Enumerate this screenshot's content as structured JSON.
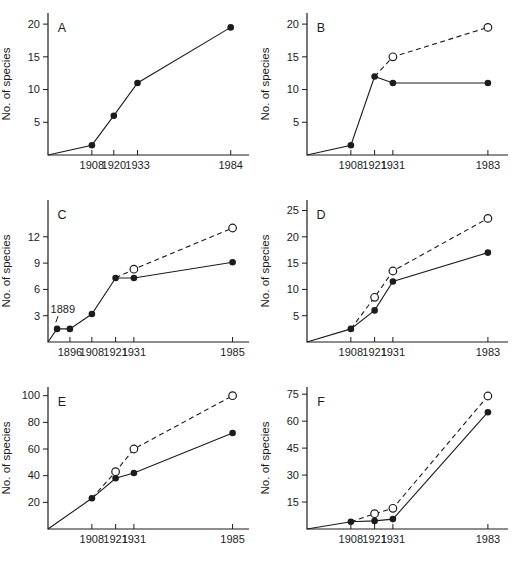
{
  "figure": {
    "background": "#ffffff",
    "ink": "#1c1c1c",
    "open_marker_fill": "#ffffff"
  },
  "chart_data": [
    {
      "type": "line",
      "panel": "A",
      "ylabel": "No. of species",
      "yticks": [
        5,
        10,
        15,
        20
      ],
      "ymax": 21.7,
      "x_domain": [
        1884,
        1994
      ],
      "xticks": [
        1908,
        1920,
        1933,
        1984
      ],
      "series": [
        {
          "name": "species recorded",
          "style": "solid",
          "marker": "filled",
          "marker_skip_first": true,
          "points": [
            [
              1884,
              0
            ],
            [
              1908,
              1.5
            ],
            [
              1920,
              6
            ],
            [
              1933,
              11
            ],
            [
              1984,
              19.5
            ]
          ]
        }
      ]
    },
    {
      "type": "line",
      "panel": "B",
      "ylabel": "No. of species",
      "yticks": [
        5,
        10,
        15,
        20
      ],
      "ymax": 21.7,
      "x_domain": [
        1884,
        1994
      ],
      "xticks": [
        1908,
        1921,
        1931,
        1983
      ],
      "series": [
        {
          "name": "species recorded",
          "style": "solid",
          "marker": "filled",
          "marker_skip_first": true,
          "points": [
            [
              1884,
              0
            ],
            [
              1908,
              1.5
            ],
            [
              1921,
              12
            ],
            [
              1931,
              11
            ],
            [
              1983,
              11
            ]
          ]
        },
        {
          "name": "cumulative species",
          "style": "dashed",
          "marker": "open",
          "marker_skip_first": true,
          "points": [
            [
              1921,
              12
            ],
            [
              1931,
              15
            ],
            [
              1983,
              19.5
            ]
          ]
        }
      ]
    },
    {
      "type": "line",
      "panel": "C",
      "ylabel": "No. of species",
      "yticks": [
        3,
        6,
        9,
        12
      ],
      "ymax": 16.2,
      "x_domain": [
        1884,
        1994
      ],
      "xticks": [
        1896,
        1908,
        1921,
        1931,
        1985
      ],
      "annotation": {
        "text": "1889",
        "label_year": 1885.4,
        "label_value": 3.3,
        "leader": [
          [
            1889.5,
            2.95
          ],
          [
            1888.3,
            2.25
          ]
        ]
      },
      "series": [
        {
          "name": "species recorded",
          "style": "solid",
          "marker": "filled",
          "marker_skip_first": true,
          "points": [
            [
              1884,
              0
            ],
            [
              1889,
              1.5
            ],
            [
              1896,
              1.5
            ],
            [
              1908,
              3.2
            ],
            [
              1921,
              7.3
            ],
            [
              1931,
              7.3
            ],
            [
              1985,
              9.1
            ]
          ]
        },
        {
          "name": "cumulative species",
          "style": "dashed",
          "marker": "open",
          "marker_skip_first": true,
          "points": [
            [
              1921,
              7.3
            ],
            [
              1931,
              8.3
            ],
            [
              1985,
              13
            ]
          ]
        }
      ]
    },
    {
      "type": "line",
      "panel": "D",
      "ylabel": "No. of species",
      "yticks": [
        5,
        10,
        15,
        20,
        25
      ],
      "ymax": 27,
      "x_domain": [
        1884,
        1994
      ],
      "xticks": [
        1908,
        1921,
        1931,
        1983
      ],
      "series": [
        {
          "name": "species recorded",
          "style": "solid",
          "marker": "filled",
          "marker_skip_first": true,
          "points": [
            [
              1884,
              0
            ],
            [
              1908,
              2.5
            ],
            [
              1921,
              6
            ],
            [
              1931,
              11.5
            ],
            [
              1983,
              17
            ]
          ]
        },
        {
          "name": "cumulative species",
          "style": "dashed",
          "marker": "open",
          "marker_skip_first": true,
          "points": [
            [
              1908,
              2.5
            ],
            [
              1921,
              8.5
            ],
            [
              1931,
              13.5
            ],
            [
              1983,
              23.5
            ]
          ]
        }
      ]
    },
    {
      "type": "line",
      "panel": "E",
      "ylabel": "No. of species",
      "yticks": [
        20,
        40,
        60,
        80,
        100
      ],
      "ymax": 106.5,
      "x_domain": [
        1884,
        1994
      ],
      "xticks": [
        1908,
        1921,
        1931,
        1985
      ],
      "series": [
        {
          "name": "species recorded",
          "style": "solid",
          "marker": "filled",
          "marker_skip_first": true,
          "points": [
            [
              1884,
              0
            ],
            [
              1908,
              23
            ],
            [
              1921,
              38
            ],
            [
              1931,
              42
            ],
            [
              1985,
              72
            ]
          ]
        },
        {
          "name": "cumulative species",
          "style": "dashed",
          "marker": "open",
          "marker_skip_first": true,
          "points": [
            [
              1908,
              23
            ],
            [
              1921,
              43
            ],
            [
              1931,
              60
            ],
            [
              1985,
              100
            ]
          ]
        }
      ]
    },
    {
      "type": "line",
      "panel": "F",
      "ylabel": "No. of species",
      "yticks": [
        15,
        30,
        45,
        60,
        75
      ],
      "ymax": 79,
      "x_domain": [
        1884,
        1994
      ],
      "xticks": [
        1908,
        1921,
        1931,
        1983
      ],
      "series": [
        {
          "name": "species recorded",
          "style": "solid",
          "marker": "filled",
          "marker_skip_first": true,
          "points": [
            [
              1884,
              0
            ],
            [
              1908,
              4
            ],
            [
              1921,
              4.5
            ],
            [
              1931,
              5.5
            ],
            [
              1983,
              65
            ]
          ]
        },
        {
          "name": "cumulative species",
          "style": "dashed",
          "marker": "open",
          "marker_skip_first": true,
          "points": [
            [
              1908,
              4
            ],
            [
              1921,
              8.5
            ],
            [
              1931,
              11.5
            ],
            [
              1983,
              74
            ]
          ]
        }
      ]
    }
  ]
}
